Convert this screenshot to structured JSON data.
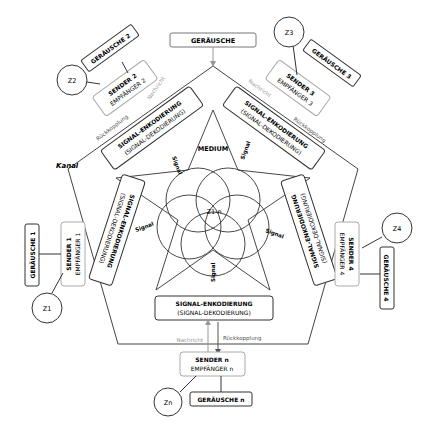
{
  "diagram": {
    "title_noise": "GERÄUSCHE",
    "medium": "MEDIUM",
    "channel": "Kanal",
    "center": "Z1-n",
    "signal": "Signal",
    "message": "Nachricht",
    "feedback": "Rückkopplung",
    "encoding": "SIGNAL-ENKODIERUNG",
    "decoding": "(SIGNAL-DEKODIERUNG)",
    "nodes": [
      {
        "sender": "SENDER 2",
        "receiver": "EMPFÄNGER 2",
        "noise": "GERÄUSCHE 2",
        "z": "Z2"
      },
      {
        "sender": "SENDER 3",
        "receiver": "EMPFÄNGER 3",
        "noise": "GERÄUSCHE 3",
        "z": "Z3"
      },
      {
        "sender": "SENDER 4",
        "receiver": "EMPFÄNGER 4",
        "noise": "GERÄUSCHE 4",
        "z": "Z4"
      },
      {
        "sender": "SENDER n",
        "receiver": "EMPFÄNGER n",
        "noise": "GERÄUSCHE n",
        "z": "Zn"
      },
      {
        "sender": "SENDER 1",
        "receiver": "EMPFÄNGER 1",
        "noise": "GERÄUSCHE 1",
        "z": "Z1"
      }
    ]
  }
}
